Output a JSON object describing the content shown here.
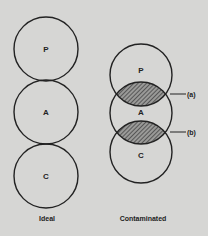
{
  "diagram": {
    "ideal": {
      "caption": "Ideal",
      "circles": [
        {
          "label": "P",
          "cx": 46,
          "cy": 49,
          "r": 32
        },
        {
          "label": "A",
          "cx": 46,
          "cy": 112,
          "r": 32
        },
        {
          "label": "C",
          "cx": 46,
          "cy": 176,
          "r": 32
        }
      ]
    },
    "contaminated": {
      "caption": "Contaminated",
      "circles": [
        {
          "label": "P",
          "cx": 141,
          "cy": 75,
          "r": 31
        },
        {
          "label": "A",
          "cx": 141,
          "cy": 113,
          "r": 31
        },
        {
          "label": "C",
          "cx": 141,
          "cy": 152,
          "r": 31
        }
      ],
      "overlaps": [
        {
          "label": "(a)",
          "y": 94
        },
        {
          "label": "(b)",
          "y": 132
        }
      ]
    },
    "colors": {
      "background": "#d6d6d4",
      "stroke": "#222222",
      "hatch": "#444444"
    }
  }
}
